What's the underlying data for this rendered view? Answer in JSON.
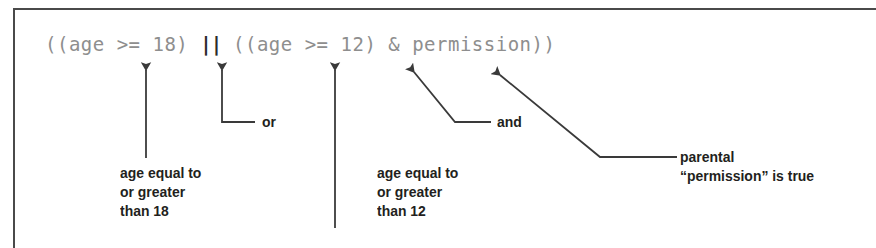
{
  "figure": {
    "code_expression": {
      "before_or": "((age >= 18) ",
      "or_operator": "||",
      "after_or": " ((age >= 12) & permission))",
      "full_text": "((age >= 18) || ((age >= 12) & permission))"
    },
    "annotations": [
      {
        "id": "age18",
        "text": "age equal to\nor greater\nthan 18",
        "target": "(age >= 18)",
        "leader_type": "vertical-arrow"
      },
      {
        "id": "or",
        "text": "or",
        "target": "||",
        "leader_type": "elbow-arrow"
      },
      {
        "id": "age12",
        "text": "age equal to\nor greater\nthan 12",
        "target": "(age >= 12)",
        "leader_type": "vertical-arrow"
      },
      {
        "id": "and",
        "text": "and",
        "target": "&",
        "leader_type": "elbow-arrow"
      },
      {
        "id": "permission",
        "text": "parental\n“permission” is true",
        "target": "permission",
        "leader_type": "diagonal-elbow-arrow"
      }
    ],
    "colors": {
      "code": "#8e8e8e",
      "operator": "#2b2b2b",
      "label": "#231f20",
      "leader": "#3a3a3a",
      "frame": "#4a4a4a",
      "background": "#ffffff"
    }
  }
}
